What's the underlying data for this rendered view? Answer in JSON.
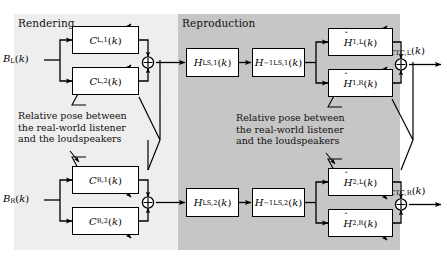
{
  "figure": {
    "type": "block-diagram",
    "background_color": "#ffffff",
    "panels": [
      {
        "id": "rendering",
        "label": "Rendering",
        "fill": "#eeeeee",
        "x": 14,
        "y": 14,
        "width": 164,
        "height": 236
      },
      {
        "id": "reproduction",
        "label": "Reproduction",
        "fill": "#c6c6c6",
        "x": 178,
        "y": 14,
        "width": 222,
        "height": 236
      }
    ]
  },
  "inputs": [
    {
      "id": "b-left",
      "label_html": "<i>B</i><sub>L</sub>(<i>k</i>)",
      "label_text": "B_L(k)"
    },
    {
      "id": "b-right",
      "label_html": "<i>B</i><sub>R</sub>(<i>k</i>)",
      "label_text": "B_R(k)"
    }
  ],
  "outputs": [
    {
      "id": "e-ctc-left",
      "label_html": "<i>E</i><sub>CTC,L</sub>(<i>k</i>)",
      "label_text": "E_CTC,L(k)"
    },
    {
      "id": "e-ctc-right",
      "label_html": "<i>E</i><sub>CTC,R</sub>(<i>k</i>)",
      "label_text": "E_CTC,R(k)"
    }
  ],
  "blocks": {
    "rendering": [
      {
        "id": "c-l-1",
        "label_html": "<i>C</i><sub>L,1</sub>(<i>k</i>)",
        "label_text": "C_L,1(k)"
      },
      {
        "id": "c-l-2",
        "label_html": "<i>C</i><sub>L,2</sub>(<i>k</i>)",
        "label_text": "C_L,2(k)"
      },
      {
        "id": "c-r-1",
        "label_html": "<i>C</i><sub>R,1</sub>(<i>k</i>)",
        "label_text": "C_R,1(k)"
      },
      {
        "id": "c-r-2",
        "label_html": "<i>C</i><sub>R,2</sub>(<i>k</i>)",
        "label_text": "C_R,2(k)"
      }
    ],
    "loudspeaker": [
      {
        "id": "h-ls-1",
        "label_html": "<i>H</i><sub>LS,1</sub>(<i>k</i>)",
        "label_text": "H_LS,1(k)"
      },
      {
        "id": "h-ls-1-inv",
        "label_html": "<i>H</i><sup>&minus;1</sup><sub>LS,1</sub>(<i>k</i>)",
        "label_text": "H^-1_LS,1(k)"
      },
      {
        "id": "h-ls-2",
        "label_html": "<i>H</i><sub>LS,2</sub>(<i>k</i>)",
        "label_text": "H_LS,2(k)"
      },
      {
        "id": "h-ls-2-inv",
        "label_html": "<i>H</i><sup>&minus;1</sup><sub>LS,2</sub>(<i>k</i>)",
        "label_text": "H^-1_LS,2(k)"
      }
    ],
    "transfer": [
      {
        "id": "h-1-l",
        "label_html": "<span class='acc'><span class='mark'>&#780;</span><i>H</i></span><sub>1,L</sub>(<i>k</i>)",
        "label_text": "Ȟ_1,L(k)"
      },
      {
        "id": "h-1-r",
        "label_html": "<span class='acc'><span class='mark'>&#780;</span><i>H</i></span><sub>1,R</sub>(<i>k</i>)",
        "label_text": "Ȟ_1,R(k)"
      },
      {
        "id": "h-2-l",
        "label_html": "<span class='acc'><span class='mark'>&#780;</span><i>H</i></span><sub>2,L</sub>(<i>k</i>)",
        "label_text": "Ȟ_2,L(k)"
      },
      {
        "id": "h-2-r",
        "label_html": "<span class='acc'><span class='mark'>&#780;</span><i>H</i></span><sub>2,R</sub>(<i>k</i>)",
        "label_text": "Ȟ_2,R(k)"
      }
    ]
  },
  "summing_junctions": [
    {
      "id": "sum-left",
      "symbol": "plus-circle"
    },
    {
      "id": "sum-right",
      "symbol": "plus-circle"
    },
    {
      "id": "sum-out-left",
      "symbol": "plus-circle"
    },
    {
      "id": "sum-out-right",
      "symbol": "plus-circle"
    }
  ],
  "annotations": [
    {
      "id": "note-rendering",
      "lines": [
        "Relative pose between",
        "the real-world listener",
        "and the loudspeakers"
      ]
    },
    {
      "id": "note-reproduction",
      "lines": [
        "Relative pose between",
        "the real-world listener",
        "and the loudspeakers"
      ]
    }
  ],
  "colors": {
    "rendering_panel": "#eeeeee",
    "reproduction_panel": "#c6c6c6",
    "block_fill": "#ffffff",
    "stroke": "#000000",
    "text": "#111111"
  }
}
